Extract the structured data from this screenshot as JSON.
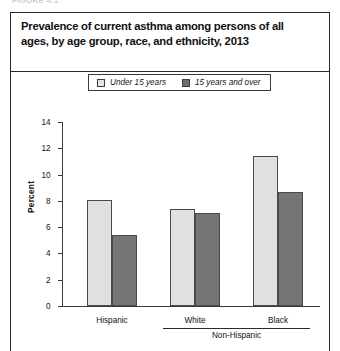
{
  "figure_kicker": "FIGURE 4.1",
  "title": "Prevalence of current asthma among persons of all ages, by age group, race, and ethnicity, 2013",
  "legend": {
    "items": [
      {
        "label": "Under 15 years",
        "swatch": "light",
        "color": "#e3e3e3"
      },
      {
        "label": "15 years and over",
        "swatch": "dark",
        "color": "#6e6e6e"
      }
    ]
  },
  "axis": {
    "y_label": "Percent",
    "y_ticks": [
      "0",
      "2",
      "4",
      "6",
      "8",
      "10",
      "12",
      "14"
    ],
    "group_bracket_label": "Non-Hispanic"
  },
  "chart_data": {
    "type": "bar",
    "title": "Prevalence of current asthma among persons of all ages, by age group, race, and ethnicity, 2013",
    "xlabel": "",
    "ylabel": "Percent",
    "ylim": [
      0,
      14
    ],
    "ytick_step": 2,
    "grid": false,
    "legend_position": "top-center",
    "categories": [
      "Hispanic",
      "White",
      "Black"
    ],
    "category_grouping": [
      {
        "label": "Hispanic",
        "members": [
          "Hispanic"
        ]
      },
      {
        "label": "Non-Hispanic",
        "members": [
          "White",
          "Black"
        ]
      }
    ],
    "series": [
      {
        "name": "Under 15 years",
        "color": "#e0e0e0",
        "values": [
          8.1,
          7.4,
          11.4
        ]
      },
      {
        "name": "15 years and over",
        "color": "#757575",
        "values": [
          5.4,
          7.1,
          8.7
        ]
      }
    ]
  }
}
